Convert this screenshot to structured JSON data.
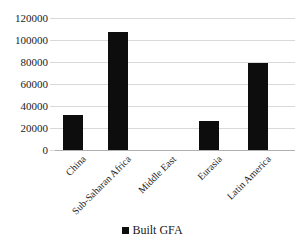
{
  "chart_data": {
    "type": "bar",
    "title": "",
    "subtitle": "",
    "xlabel": "",
    "ylabel": "",
    "categories": [
      "China",
      "Sub-Saharan Africa",
      "Middle East",
      "Eurasia",
      "Latin America"
    ],
    "series": [
      {
        "name": "Built GFA",
        "color": "#0d0d0d",
        "values": [
          32000,
          107000,
          0,
          26500,
          79000
        ]
      }
    ],
    "values": [
      32000,
      107000,
      0,
      26500,
      79000
    ],
    "ylim": [
      0,
      120000
    ],
    "yticks": [
      0,
      20000,
      40000,
      60000,
      80000,
      100000,
      120000
    ],
    "ytick_labels": [
      "0",
      "20000",
      "40000",
      "60000",
      "80000",
      "100000",
      "120000"
    ],
    "grid": true,
    "grid_axis": "y",
    "legend": {
      "position": "bottom",
      "entries": [
        {
          "label": "Built GFA",
          "color": "#0d0d0d",
          "marker": "square"
        }
      ]
    },
    "xtick_rotation": -45,
    "colors": {
      "bar": "#0d0d0d",
      "gridline": "#d9d9d9",
      "baseline": "#b0b0b0",
      "text": "#1a1a1a",
      "background": "#ffffff"
    }
  }
}
